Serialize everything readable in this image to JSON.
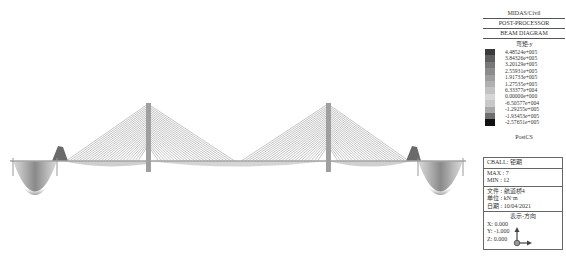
{
  "legend": {
    "header": [
      "MIDAS/Civil",
      "POST-PROCESSOR",
      "BEAM DIAGRAM"
    ],
    "component": "弯矩-y",
    "scale": [
      {
        "value": "4.48524e+005",
        "color": "#3a3a3a"
      },
      {
        "value": "3.84326e+005",
        "color": "#5e5e5e"
      },
      {
        "value": "3.20129e+005",
        "color": "#787878"
      },
      {
        "value": "2.55931e+005",
        "color": "#8c8c8c"
      },
      {
        "value": "1.91733e+005",
        "color": "#9e9e9e"
      },
      {
        "value": "1.27535e+005",
        "color": "#b0b0b0"
      },
      {
        "value": "6.33377e+004",
        "color": "#c2c2c2"
      },
      {
        "value": "0.00000e+000",
        "color": "#d6d6d6"
      },
      {
        "value": "-6.50577e+004",
        "color": "#c8c8c8"
      },
      {
        "value": "-1.29255e+005",
        "color": "#a8a8a8"
      },
      {
        "value": "-1.93453e+005",
        "color": "#6e6e6e"
      },
      {
        "value": "-2.57651e+005",
        "color": "#111111"
      }
    ],
    "stage": "PostCS"
  },
  "info": {
    "load_case": "CBALL: 钜期",
    "max": "MAX : 7",
    "min": "MIN : 12",
    "file": "文件 : 航道桥4",
    "unit": "单位 : kN·m",
    "date": "日期 : 10/04/2021",
    "view_dir_title": "表示-方向",
    "x": "X: 0.000",
    "y": "Y: -1.000",
    "z": "Z: 0.000"
  },
  "diagram": {
    "deck_y": 161,
    "deck_x_start": 10,
    "deck_x_end": 462,
    "towers": [
      {
        "name": "tower-left",
        "x": 148,
        "top_y": 103,
        "base_y": 172
      },
      {
        "name": "tower-right",
        "x": 328,
        "top_y": 103,
        "base_y": 172
      }
    ],
    "aux_piers": [
      {
        "x": 13,
        "y2": 176
      },
      {
        "x": 57,
        "y2": 176
      },
      {
        "x": 418,
        "y2": 176
      },
      {
        "x": 463,
        "y2": 176
      }
    ],
    "cable_count_per_side": 24,
    "colors": {
      "cable": "#8a8a8a",
      "tower": "#9a9a9a",
      "deck": "#b5b5b5"
    }
  }
}
